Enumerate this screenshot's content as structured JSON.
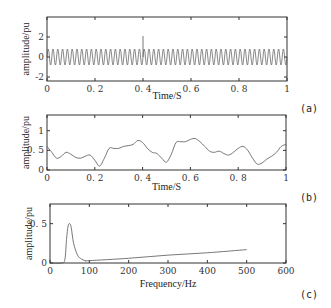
{
  "chart_data": [
    {
      "type": "line",
      "panel_label": "(a)",
      "xlabel": "Time/S",
      "ylabel": "amplitude/pu",
      "xlim": [
        0,
        1
      ],
      "ylim": [
        -2.4,
        4
      ],
      "xticks": [
        "0",
        "0.2",
        "0.4",
        "0.6",
        "0.8",
        "1"
      ],
      "yticks": [
        "-2",
        "0",
        "2"
      ],
      "series": [
        {
          "name": "signal",
          "description": "50 Hz sinusoid, amplitude ~0.8 pu, with a transient spike to ~2 at t=0.4 s",
          "frequency_hz": 50,
          "amplitude": 0.8,
          "spike": {
            "x": 0.4,
            "y": 2.1
          }
        }
      ],
      "grid": false
    },
    {
      "type": "line",
      "panel_label": "(b)",
      "xlabel": "Time/S",
      "ylabel": "amplitude/pu",
      "xlim": [
        0,
        1
      ],
      "ylim": [
        0,
        1.4
      ],
      "xticks": [
        "0",
        "0.2",
        "0.4",
        "0.6",
        "0.8",
        "1"
      ],
      "yticks": [
        "0",
        "0.5",
        "1"
      ],
      "series": [
        {
          "name": "envelope",
          "x": [
            0,
            0.02,
            0.04,
            0.06,
            0.08,
            0.1,
            0.12,
            0.14,
            0.16,
            0.18,
            0.2,
            0.22,
            0.24,
            0.26,
            0.28,
            0.3,
            0.32,
            0.34,
            0.36,
            0.38,
            0.4,
            0.42,
            0.44,
            0.46,
            0.48,
            0.5,
            0.52,
            0.54,
            0.56,
            0.58,
            0.6,
            0.62,
            0.64,
            0.66,
            0.68,
            0.7,
            0.72,
            0.74,
            0.76,
            0.78,
            0.8,
            0.82,
            0.84,
            0.86,
            0.88,
            0.9,
            0.92,
            0.94,
            0.96,
            0.98,
            1.0
          ],
          "values": [
            0.6,
            0.45,
            0.3,
            0.35,
            0.45,
            0.4,
            0.32,
            0.3,
            0.35,
            0.38,
            0.25,
            0.1,
            0.3,
            0.55,
            0.55,
            0.55,
            0.6,
            0.62,
            0.65,
            0.75,
            0.7,
            0.55,
            0.45,
            0.42,
            0.3,
            0.2,
            0.4,
            0.7,
            0.72,
            0.72,
            0.78,
            0.8,
            0.72,
            0.6,
            0.48,
            0.45,
            0.48,
            0.42,
            0.38,
            0.45,
            0.55,
            0.6,
            0.5,
            0.3,
            0.15,
            0.18,
            0.28,
            0.35,
            0.45,
            0.6,
            0.65
          ]
        }
      ],
      "grid": false
    },
    {
      "type": "line",
      "panel_label": "(c)",
      "xlabel": "Frequency/Hz",
      "ylabel": "amplitude/pu",
      "xlim": [
        0,
        600
      ],
      "ylim": [
        0,
        0.75
      ],
      "xticks": [
        "0",
        "100",
        "200",
        "300",
        "400",
        "500",
        "600"
      ],
      "yticks": [
        "0",
        "0.5"
      ],
      "series": [
        {
          "name": "spectrum",
          "x": [
            0,
            30,
            38,
            42,
            46,
            50,
            54,
            60,
            70,
            80,
            90,
            100,
            200,
            300,
            400,
            500
          ],
          "values": [
            0.0,
            0.0,
            0.05,
            0.3,
            0.47,
            0.5,
            0.45,
            0.25,
            0.1,
            0.05,
            0.03,
            0.03,
            0.06,
            0.1,
            0.13,
            0.17
          ]
        }
      ],
      "grid": false
    }
  ]
}
